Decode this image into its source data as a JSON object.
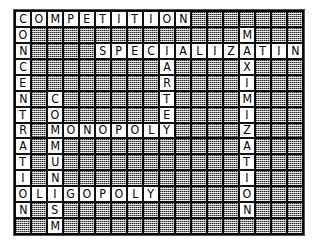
{
  "puzzle": {
    "title": "Economics crossword grid",
    "columns": 18,
    "rows": 14,
    "colors": {
      "page_background": "#ffffff",
      "grid_line": "#000000",
      "shaded_cell": "#8f8f8f",
      "letter_cell": "#ffffff",
      "letter_text": "#000000",
      "outer_border": "#555555"
    },
    "entries": [
      {
        "answer": "COMPETITION",
        "direction": "across",
        "row": 0,
        "col": 0,
        "length": 11
      },
      {
        "answer": "CONCENTRATION",
        "direction": "down",
        "row": 0,
        "col": 0,
        "length": 13
      },
      {
        "answer": "MAXIMIZATION",
        "direction": "down",
        "row": 1,
        "col": 14,
        "length": 12
      },
      {
        "answer": "SPECIALIZATION",
        "direction": "across",
        "row": 2,
        "col": 5,
        "length": 14
      },
      {
        "answer": "CARTEL",
        "direction": "down",
        "row": 2,
        "col": 9,
        "length": 6
      },
      {
        "answer": "COMMUNISM",
        "direction": "down",
        "row": 5,
        "col": 2,
        "length": 9
      },
      {
        "answer": "MONOPOLY",
        "direction": "across",
        "row": 7,
        "col": 2,
        "length": 8
      },
      {
        "answer": "OLIGOPOLY",
        "direction": "across",
        "row": 11,
        "col": 0,
        "length": 9
      }
    ],
    "letter_rows": [
      [
        "C",
        "O",
        "M",
        "P",
        "E",
        "T",
        "I",
        "T",
        "I",
        "O",
        "N",
        "",
        "",
        "",
        "",
        "",
        "",
        ""
      ],
      [
        "O",
        "",
        "",
        "",
        "",
        "",
        "",
        "",
        "",
        "",
        "",
        "",
        "",
        "",
        "M",
        "",
        "",
        ""
      ],
      [
        "N",
        "",
        "",
        "",
        "",
        "S",
        "P",
        "E",
        "C",
        "I",
        "A",
        "L",
        "I",
        "Z",
        "A",
        "T",
        "I",
        "O"
      ],
      [
        "C",
        "",
        "",
        "",
        "",
        "",
        "",
        "",
        "",
        "A",
        "",
        "",
        "",
        "",
        "X",
        "",
        "",
        ""
      ],
      [
        "E",
        "",
        "",
        "",
        "",
        "",
        "",
        "",
        "",
        "R",
        "",
        "",
        "",
        "",
        "I",
        "",
        "",
        ""
      ],
      [
        "N",
        "",
        "C",
        "",
        "",
        "",
        "",
        "",
        "",
        "T",
        "",
        "",
        "",
        "",
        "M",
        "",
        "",
        ""
      ],
      [
        "T",
        "",
        "O",
        "",
        "",
        "",
        "",
        "",
        "",
        "E",
        "",
        "",
        "",
        "",
        "I",
        "",
        "",
        ""
      ],
      [
        "R",
        "",
        "M",
        "O",
        "N",
        "O",
        "P",
        "O",
        "L",
        "Y",
        "",
        "",
        "",
        "",
        "Z",
        "",
        "",
        ""
      ],
      [
        "A",
        "",
        "M",
        "",
        "",
        "",
        "",
        "",
        "",
        "",
        "",
        "",
        "",
        "",
        "A",
        "",
        "",
        ""
      ],
      [
        "T",
        "",
        "U",
        "",
        "",
        "",
        "",
        "",
        "",
        "",
        "",
        "",
        "",
        "",
        "T",
        "",
        "",
        ""
      ],
      [
        "I",
        "",
        "N",
        "",
        "",
        "",
        "",
        "",
        "",
        "",
        "",
        "",
        "",
        "",
        "I",
        "",
        "",
        ""
      ],
      [
        "O",
        "L",
        "I",
        "G",
        "O",
        "P",
        "O",
        "L",
        "Y",
        "",
        "",
        "",
        "",
        "",
        "O",
        "",
        "",
        ""
      ],
      [
        "N",
        "",
        "S",
        "",
        "",
        "",
        "",
        "",
        "",
        "",
        "",
        "",
        "",
        "",
        "N",
        "",
        "",
        ""
      ],
      [
        "",
        "",
        "M",
        "",
        "",
        "",
        "",
        "",
        "",
        "",
        "",
        "",
        "",
        "",
        "",
        "",
        "",
        ""
      ]
    ],
    "extra_row2_tail": "N"
  }
}
